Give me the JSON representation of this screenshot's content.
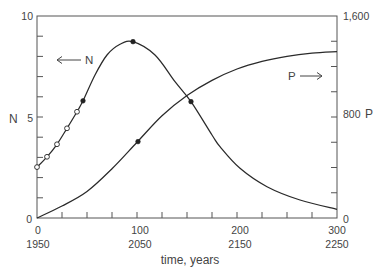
{
  "chart_data": {
    "type": "line",
    "title": "",
    "xlabel": "time, years",
    "ylabel_left": "N",
    "ylabel_right": "P",
    "xlim": [
      0,
      300
    ],
    "ylim_left": [
      0,
      10
    ],
    "ylim_right": [
      0,
      1600
    ],
    "grid": false,
    "legend": null,
    "x_tick_step": 25,
    "y_left_tick_step": 1,
    "y_right_tick_step": 200,
    "x_tick_labels": [
      {
        "value": 0,
        "label": "0",
        "year": "1950"
      },
      {
        "value": 100,
        "label": "100",
        "year": "2050"
      },
      {
        "value": 200,
        "label": "200",
        "year": "2150"
      },
      {
        "value": 300,
        "label": "300",
        "year": "2250"
      }
    ],
    "y_left_tick_labels": [
      {
        "value": 0,
        "label": "0"
      },
      {
        "value": 5,
        "label": "5"
      },
      {
        "value": 10,
        "label": "10"
      }
    ],
    "y_right_tick_labels": [
      {
        "value": 0,
        "label": "0"
      },
      {
        "value": 800,
        "label": "800"
      },
      {
        "value": 1600,
        "label": "1,600"
      }
    ],
    "annotations": [
      {
        "series": "N",
        "text": "N",
        "arrow": "left"
      },
      {
        "series": "P",
        "text": "P",
        "arrow": "right"
      }
    ],
    "series": [
      {
        "name": "N",
        "axis": "left",
        "x": [
          0,
          10,
          20,
          30,
          40,
          46,
          58,
          70,
          83,
          96,
          118,
          138,
          154,
          175,
          183,
          203,
          230,
          263,
          300
        ],
        "values": [
          2.52,
          3.03,
          3.65,
          4.44,
          5.26,
          5.8,
          7.08,
          8.07,
          8.6,
          8.73,
          8.07,
          6.75,
          5.76,
          4.11,
          3.53,
          2.46,
          1.55,
          0.89,
          0.43
        ],
        "markers": [
          {
            "x": 0,
            "y": 2.52,
            "style": "open"
          },
          {
            "x": 10,
            "y": 3.03,
            "style": "open"
          },
          {
            "x": 20,
            "y": 3.65,
            "style": "open"
          },
          {
            "x": 30,
            "y": 4.44,
            "style": "open"
          },
          {
            "x": 40,
            "y": 5.26,
            "style": "open"
          },
          {
            "x": 46,
            "y": 5.8,
            "style": "filled"
          },
          {
            "x": 96,
            "y": 8.73,
            "style": "filled"
          },
          {
            "x": 154,
            "y": 5.76,
            "style": "filled"
          }
        ]
      },
      {
        "name": "P",
        "axis": "right",
        "x": [
          0,
          25,
          50,
          75,
          100,
          125,
          150,
          175,
          200,
          225,
          250,
          275,
          300
        ],
        "values": [
          0,
          95,
          210,
          390,
          600,
          810,
          970,
          1090,
          1180,
          1240,
          1280,
          1305,
          1318
        ],
        "markers": [
          {
            "x": 101,
            "y": 605,
            "style": "filled"
          }
        ]
      }
    ]
  }
}
